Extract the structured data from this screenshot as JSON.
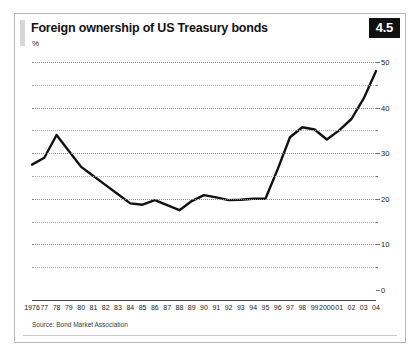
{
  "figure": {
    "title": "Foreign ownership of US Treasury bonds",
    "unit": "%",
    "number": "4.5",
    "source": "Source: Bond Market Association"
  },
  "chart_data": {
    "type": "line",
    "title": "Foreign ownership of US Treasury bonds",
    "subtitle": "",
    "xlabel": "",
    "ylabel": "%",
    "ylim": [
      0,
      50
    ],
    "yticks": [
      0,
      10,
      20,
      30,
      40,
      50
    ],
    "ytick_labels": [
      "0",
      "10",
      "20",
      "30",
      "40",
      "50"
    ],
    "minor_yticks": [
      5,
      15,
      25,
      35,
      45
    ],
    "grid": true,
    "grid_style": "dotted",
    "y_axis_position": "right",
    "legend": "none",
    "line_color": "#111111",
    "line_width": 2.4,
    "categories": [
      "1976",
      "77",
      "78",
      "79",
      "80",
      "81",
      "82",
      "83",
      "84",
      "85",
      "86",
      "87",
      "88",
      "89",
      "90",
      "91",
      "92",
      "93",
      "94",
      "95",
      "96",
      "97",
      "98",
      "99",
      "2000",
      "01",
      "02",
      "03",
      "04"
    ],
    "x": [
      1976,
      1977,
      1978,
      1979,
      1980,
      1981,
      1982,
      1983,
      1984,
      1985,
      1986,
      1987,
      1988,
      1989,
      1990,
      1991,
      1992,
      1993,
      1994,
      1995,
      1996,
      1997,
      1998,
      1999,
      2000,
      2001,
      2002,
      2003,
      2004
    ],
    "values": [
      27.5,
      29.0,
      34.0,
      30.5,
      27.0,
      25.0,
      23.0,
      21.0,
      19.0,
      18.7,
      19.7,
      18.6,
      17.5,
      19.5,
      20.8,
      20.3,
      19.7,
      19.8,
      20.0,
      20.0,
      26.5,
      33.5,
      35.7,
      35.2,
      33.0,
      35.0,
      37.5,
      42.0,
      48.0
    ]
  }
}
